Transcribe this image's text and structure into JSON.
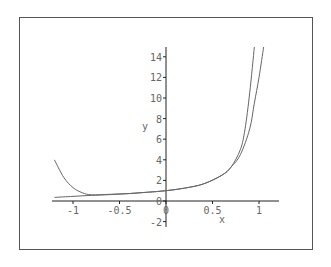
{
  "chart_data": {
    "type": "line",
    "title": "",
    "xlabel": "x",
    "ylabel": "y",
    "xlim": [
      -1.2,
      1.2
    ],
    "ylim": [
      -2,
      15
    ],
    "x_ticks": [
      "-1",
      "-0.5",
      "0",
      "0.5",
      "1"
    ],
    "y_ticks": [
      "-2",
      "0",
      "2",
      "4",
      "6",
      "8",
      "10",
      "12",
      "14"
    ],
    "grid": false,
    "legend": null,
    "series": [
      {
        "name": "curve-1",
        "x": [
          -1.2,
          -1.1,
          -1.0,
          -0.9,
          -0.8,
          -0.6,
          -0.4,
          -0.2,
          0,
          0.2,
          0.4,
          0.6,
          0.7,
          0.8,
          0.85,
          0.9,
          0.95
        ],
        "y": [
          4.0,
          2.3,
          1.3,
          0.8,
          0.6,
          0.65,
          0.72,
          0.85,
          1.0,
          1.25,
          1.65,
          2.5,
          3.3,
          5.0,
          7.0,
          10.5,
          15.0
        ]
      },
      {
        "name": "curve-2",
        "x": [
          -1.2,
          -1.0,
          -0.8,
          -0.6,
          -0.4,
          -0.2,
          0,
          0.2,
          0.4,
          0.6,
          0.7,
          0.8,
          0.9,
          0.95,
          1.0,
          1.05
        ],
        "y": [
          0.35,
          0.45,
          0.55,
          0.62,
          0.72,
          0.85,
          1.0,
          1.25,
          1.65,
          2.5,
          3.3,
          4.5,
          7.0,
          9.5,
          12.0,
          15.0
        ]
      }
    ]
  },
  "axes": {
    "x_label": "x",
    "y_label": "y",
    "x_ticks": [
      {
        "label": "-1",
        "value": -1
      },
      {
        "label": "-0.5",
        "value": -0.5
      },
      {
        "label": "0",
        "value": 0
      },
      {
        "label": "0.5",
        "value": 0.5
      },
      {
        "label": "1",
        "value": 1
      }
    ],
    "y_ticks": [
      {
        "label": "-2",
        "value": -2
      },
      {
        "label": "0",
        "value": 0
      },
      {
        "label": "2",
        "value": 2
      },
      {
        "label": "4",
        "value": 4
      },
      {
        "label": "6",
        "value": 6
      },
      {
        "label": "8",
        "value": 8
      },
      {
        "label": "10",
        "value": 10
      },
      {
        "label": "12",
        "value": 12
      },
      {
        "label": "14",
        "value": 14
      }
    ]
  },
  "colors": {
    "curve": "#666666",
    "axis": "#222222",
    "frame": "#555555",
    "text": "#666666"
  }
}
